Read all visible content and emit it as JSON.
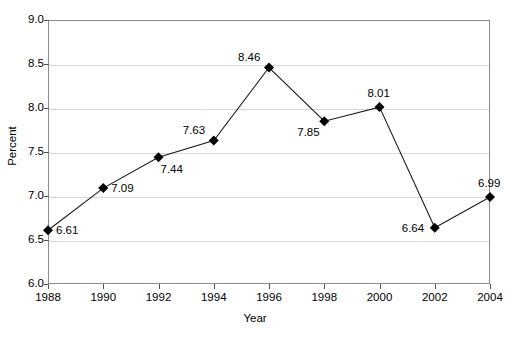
{
  "chart_data": {
    "type": "line",
    "title": "",
    "xlabel": "Year",
    "ylabel": "Percent",
    "categories": [
      1988,
      1990,
      1992,
      1994,
      1996,
      1998,
      2000,
      2002,
      2004
    ],
    "x_tick_labels": [
      "1988",
      "1990",
      "1992",
      "1994",
      "1996",
      "1998",
      "2000",
      "2002",
      "2004"
    ],
    "values": [
      6.61,
      7.09,
      7.44,
      7.63,
      8.46,
      7.85,
      8.01,
      6.64,
      6.99
    ],
    "point_labels": [
      "6.61",
      "7.09",
      "7.44",
      "7.63",
      "8.46",
      "7.85",
      "8.01",
      "6.64",
      "6.99"
    ],
    "label_positions": [
      "right",
      "right",
      "below-right",
      "above-left",
      "above-left",
      "below-left",
      "above",
      "left",
      "above"
    ],
    "ylim": [
      6.0,
      9.0
    ],
    "y_ticks": [
      6.0,
      6.5,
      7.0,
      7.5,
      8.0,
      8.5,
      9.0
    ],
    "y_tick_labels": [
      "6.0",
      "6.5",
      "7.0",
      "7.5",
      "8.0",
      "8.5",
      "9.0"
    ],
    "xlim": [
      1988,
      2004
    ],
    "grid": "horizontal",
    "legend": "none",
    "marker": "diamond",
    "series_color": "#1a1a1a",
    "marker_color": "#000000",
    "gridline_color": "#d9d9d9",
    "axis_color": "#8c8c8c",
    "background_color": "#ffffff"
  }
}
